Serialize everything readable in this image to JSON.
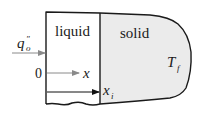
{
  "diagram": {
    "type": "phase-change-slab",
    "regions": {
      "liquid": {
        "label": "liquid",
        "fill": "#ffffff"
      },
      "solid": {
        "label": "solid",
        "fill": "#ebebeb",
        "temperature_label": "T",
        "temperature_subscript": "f"
      }
    },
    "heat_flux": {
      "symbol": "q",
      "superscript": "″",
      "subscript": "o",
      "arrow_color": "#8a8a8a"
    },
    "origin_label": "0",
    "x_axis": {
      "label": "x",
      "arrow_color": "#8a8a8a"
    },
    "interface": {
      "label": "x",
      "subscript": "i",
      "arrow_color": "#111111"
    },
    "colors": {
      "outline": "#1a1a1a",
      "solid_fill": "#ebebeb",
      "background": "#ffffff"
    }
  }
}
